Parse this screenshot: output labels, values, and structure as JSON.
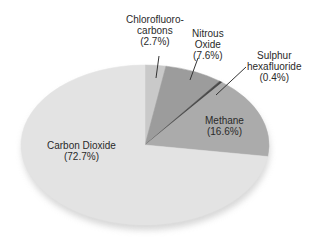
{
  "chart_data": {
    "type": "pie",
    "title": "",
    "start_angle_deg": 90,
    "direction": "clockwise",
    "slices": [
      {
        "label": "Chlorofluorocarbons",
        "label_lines": [
          "Chlorofluoro-",
          "carbons",
          "(2.7%)"
        ],
        "value": 2.7,
        "color": "#c9c9c9"
      },
      {
        "label": "Nitrous Oxide",
        "label_lines": [
          "Nitrous",
          "Oxide",
          "(7.6%)"
        ],
        "value": 7.6,
        "color": "#9c9c9c"
      },
      {
        "label": "Sulphur hexafluoride",
        "label_lines": [
          "Sulphur",
          "hexafluoride",
          "(0.4%)"
        ],
        "value": 0.4,
        "color": "#4a4a4a"
      },
      {
        "label": "Methane",
        "label_lines": [
          "Methane",
          "(16.6%)"
        ],
        "value": 16.6,
        "color": "#ababab"
      },
      {
        "label": "Carbon Dioxide",
        "label_lines": [
          "Carbon Dioxide",
          "(72.7%)"
        ],
        "value": 72.7,
        "color": "#e3e3e3"
      }
    ],
    "units": "%",
    "legend": "none (direct labels)"
  }
}
